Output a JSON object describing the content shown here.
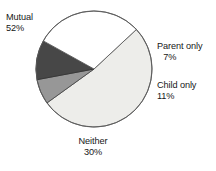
{
  "chart_data": {
    "type": "pie",
    "title": "",
    "xlabel": "",
    "ylabel": "",
    "legend_position": "none",
    "grid": false,
    "start_angle_deg": 47,
    "direction": "clockwise",
    "center": {
      "x": 94,
      "y": 69
    },
    "radius": 58,
    "categories": [
      "Mutual",
      "Parent only",
      "Child only",
      "Neither"
    ],
    "values": [
      52,
      7,
      11,
      30
    ],
    "value_unit": "percent",
    "slices": [
      {
        "label": "Mutual",
        "value": 52,
        "value_text": "52%",
        "color": "#ededea",
        "stroke": "#5a5a5a"
      },
      {
        "label": "Parent only",
        "value": 7,
        "value_text": "7%",
        "color": "#979797",
        "stroke": "#4a4a4a"
      },
      {
        "label": "Child only",
        "value": 11,
        "value_text": "11%",
        "color": "#474747",
        "stroke": "#353535"
      },
      {
        "label": "Neither",
        "value": 30,
        "value_text": "30%",
        "color": "#ffffff",
        "stroke": "#5a5a5a"
      }
    ]
  },
  "labels": {
    "mutual": {
      "name": "Mutual",
      "value": "52%"
    },
    "parent_only": {
      "name": "Parent only",
      "value": "7%"
    },
    "child_only": {
      "name": "Child only",
      "value": "11%"
    },
    "neither": {
      "name": "Neither",
      "value": "30%"
    }
  },
  "colors": {
    "background": "#ffffff",
    "text": "#171717",
    "outline": "#5a5a5a",
    "slice_mutual": "#ededea",
    "slice_parent_only": "#979797",
    "slice_child_only": "#474747",
    "slice_neither": "#ffffff"
  }
}
